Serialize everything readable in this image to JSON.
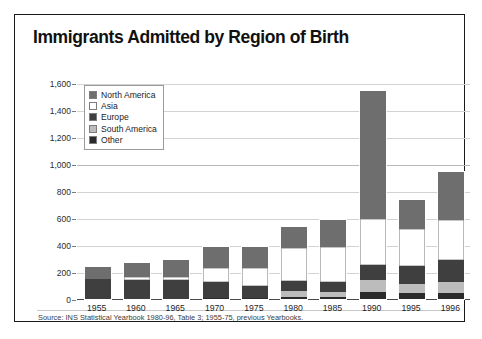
{
  "chart_data": {
    "type": "bar",
    "subtype": "stacked-column",
    "title": "Immigrants Admitted by Region of Birth",
    "xlabel": "",
    "ylabel": "",
    "ylim": [
      0,
      1600
    ],
    "yticks": [
      0,
      200,
      400,
      600,
      800,
      1000,
      1200,
      1400,
      1600
    ],
    "ytick_labels": [
      "0",
      "200",
      "400",
      "600",
      "800",
      "1,000",
      "1,200",
      "1,400",
      "1,600"
    ],
    "units_note": "thousands",
    "grid": true,
    "legend_position": "top-left-inside",
    "categories": [
      "1955",
      "1960",
      "1965",
      "1970",
      "1975",
      "1980",
      "1985",
      "1990",
      "1995",
      "1996"
    ],
    "series": [
      {
        "name": "Other",
        "color": "#2b2b2b",
        "values": [
          0,
          0,
          0,
          8,
          10,
          12,
          14,
          55,
          45,
          48
        ]
      },
      {
        "name": "South America",
        "color": "#bcbcbc",
        "values": [
          0,
          0,
          0,
          0,
          0,
          45,
          40,
          85,
          70,
          75
        ]
      },
      {
        "name": "Europe",
        "color": "#3f3f3f",
        "values": [
          145,
          140,
          140,
          120,
          85,
          75,
          70,
          115,
          130,
          165
        ]
      },
      {
        "name": "Asia",
        "color": "#ffffff",
        "values": [
          0,
          20,
          22,
          100,
          135,
          245,
          265,
          340,
          275,
          300
        ]
      },
      {
        "name": "North America",
        "color": "#6e6e6e",
        "values": [
          95,
          105,
          130,
          160,
          155,
          155,
          200,
          945,
          215,
          355
        ]
      }
    ],
    "totals": [
      240,
      265,
      292,
      388,
      385,
      532,
      589,
      1540,
      735,
      943
    ],
    "annotations": {
      "source": "Source: INS Statistical Yearbook 1980-96, Table 3; 1955-75, previous Yearbooks."
    }
  },
  "legend": {
    "items": [
      {
        "label": "North America",
        "color": "#6e6e6e"
      },
      {
        "label": "Asia",
        "color": "#ffffff"
      },
      {
        "label": "Europe",
        "color": "#3f3f3f"
      },
      {
        "label": "South America",
        "color": "#bcbcbc"
      },
      {
        "label": "Other",
        "color": "#2b2b2b"
      }
    ]
  }
}
